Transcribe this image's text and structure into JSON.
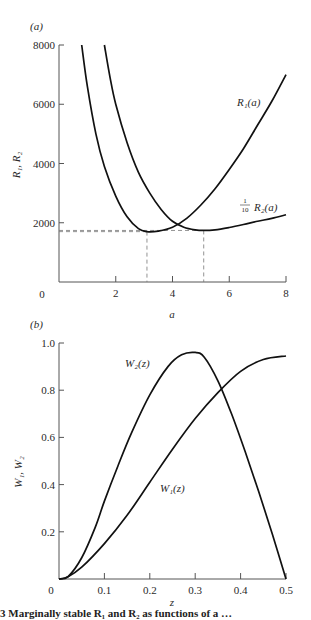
{
  "chart_data": [
    {
      "type": "line",
      "panel_label": "(a)",
      "title": "",
      "xlabel": "a",
      "ylabel": "R1, R2",
      "xlim": [
        0,
        8
      ],
      "ylim": [
        0,
        8000
      ],
      "x_ticks": [
        0,
        2,
        4,
        6,
        8
      ],
      "y_ticks": [
        2000,
        4000,
        6000,
        8000
      ],
      "grid": false,
      "series": [
        {
          "name": "R1(a)",
          "x": [
            0.8,
            1.0,
            1.3,
            1.6,
            2.0,
            2.4,
            2.8,
            3.1,
            3.5,
            4.0,
            4.5,
            5.0,
            5.5,
            6.0,
            6.5,
            7.0,
            7.5,
            8.0
          ],
          "y": [
            8000,
            6600,
            5000,
            3900,
            2900,
            2200,
            1800,
            1700,
            1720,
            1850,
            2150,
            2600,
            3150,
            3800,
            4500,
            5300,
            6100,
            7000
          ]
        },
        {
          "name": "1/10 R2(a)",
          "x": [
            1.6,
            1.8,
            2.0,
            2.4,
            2.8,
            3.2,
            3.6,
            4.0,
            4.4,
            4.8,
            5.1,
            5.5,
            6.0,
            6.5,
            7.0,
            7.5,
            8.0
          ],
          "y": [
            8000,
            6900,
            6000,
            4700,
            3700,
            3000,
            2450,
            2050,
            1850,
            1760,
            1740,
            1760,
            1840,
            1940,
            2050,
            2150,
            2270
          ]
        }
      ],
      "annotations": [
        {
          "type": "dashed-guide",
          "x": 3.1,
          "y": 1700
        },
        {
          "type": "dashed-guide",
          "x": 5.1,
          "y": 1740
        }
      ]
    },
    {
      "type": "line",
      "panel_label": "(b)",
      "title": "",
      "xlabel": "z",
      "ylabel": "W1, W2",
      "xlim": [
        0,
        0.5
      ],
      "ylim": [
        0,
        1.0
      ],
      "x_ticks": [
        0,
        0.1,
        0.2,
        0.3,
        0.4,
        0.5
      ],
      "y_ticks": [
        0.2,
        0.4,
        0.6,
        0.8,
        1.0
      ],
      "grid": false,
      "series": [
        {
          "name": "W2(z)",
          "x": [
            0,
            0.02,
            0.05,
            0.08,
            0.1,
            0.13,
            0.16,
            0.2,
            0.24,
            0.27,
            0.3,
            0.32,
            0.35,
            0.38,
            0.41,
            0.44,
            0.47,
            0.5
          ],
          "y": [
            0,
            0.01,
            0.09,
            0.22,
            0.33,
            0.48,
            0.62,
            0.78,
            0.9,
            0.95,
            0.96,
            0.94,
            0.84,
            0.7,
            0.54,
            0.37,
            0.19,
            0.0
          ]
        },
        {
          "name": "W1(z)",
          "x": [
            0,
            0.02,
            0.05,
            0.1,
            0.15,
            0.2,
            0.25,
            0.3,
            0.35,
            0.4,
            0.45,
            0.5
          ],
          "y": [
            0,
            0.01,
            0.05,
            0.15,
            0.27,
            0.41,
            0.55,
            0.68,
            0.79,
            0.88,
            0.93,
            0.945
          ]
        }
      ]
    }
  ],
  "labels": {
    "panel_a": "(a)",
    "panel_b": "(b)",
    "a_xlabel": "a",
    "a_ylabel": "R₁, R₂",
    "b_xlabel": "z",
    "b_ylabel": "W₁, W₂",
    "r1_label": "R₁(a)",
    "r2_fraction_num": "1",
    "r2_fraction_den": "10",
    "r2_label": "R₂(a)",
    "w2_label": "W₂(z)",
    "w1_label": "W₁(z)",
    "origin_a": "0",
    "origin_b": "0",
    "caption": "3  Marginally stable R₁ and R₂ as functions of a …"
  }
}
